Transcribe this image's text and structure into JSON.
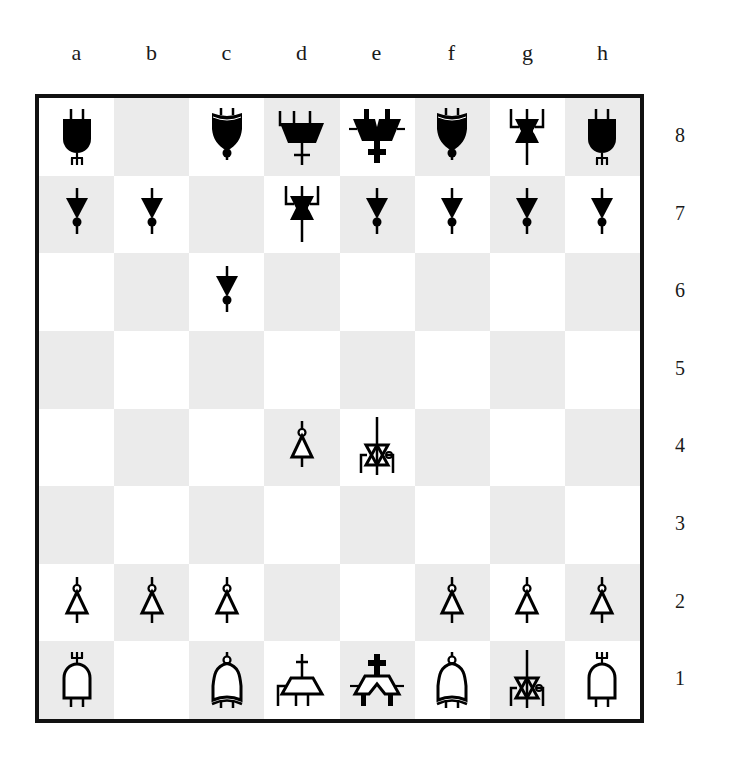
{
  "board": {
    "files": [
      "a",
      "b",
      "c",
      "d",
      "e",
      "f",
      "g",
      "h"
    ],
    "ranks": [
      "8",
      "7",
      "6",
      "5",
      "4",
      "3",
      "2",
      "1"
    ],
    "colors": {
      "light_square": "#ffffff",
      "dark_square": "#ebebeb",
      "border": "#111111",
      "piece": "#000000"
    },
    "position": {
      "a8": "bR",
      "c8": "bB",
      "d8": "bQ",
      "e8": "bK",
      "f8": "bB",
      "g8": "bN",
      "h8": "bR",
      "a7": "bP",
      "b7": "bP",
      "d7": "bN",
      "e7": "bP",
      "f7": "bP",
      "g7": "bP",
      "h7": "bP",
      "c6": "bP",
      "d4": "wP",
      "e4": "wN",
      "a2": "wP",
      "b2": "wP",
      "c2": "wP",
      "f2": "wP",
      "g2": "wP",
      "h2": "wP",
      "a1": "wR",
      "c1": "wB",
      "d1": "wQ",
      "e1": "wK",
      "f1": "wB",
      "g1": "wN",
      "h1": "wR"
    },
    "piece_names": {
      "P": "pawn",
      "N": "knight",
      "B": "bishop",
      "R": "rook",
      "Q": "queen",
      "K": "king"
    }
  }
}
